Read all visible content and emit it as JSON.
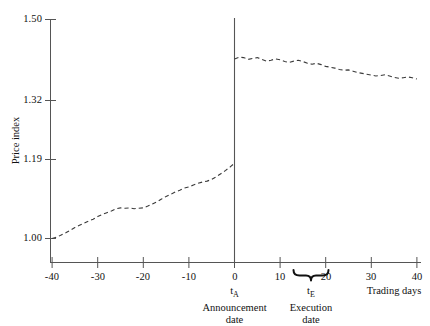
{
  "chart_data": {
    "type": "line",
    "title": "",
    "subtitle": "",
    "xlabel": "Trading days",
    "ylabel": "Price index",
    "xlim": [
      -40,
      40
    ],
    "ylim": [
      0.955,
      1.52
    ],
    "grid": false,
    "legend": null,
    "y_ticks": [
      "1.00",
      "1.19",
      "1.32",
      "1.50"
    ],
    "y_tick_values": [
      1.0,
      1.19,
      1.32,
      1.5
    ],
    "x_ticks": [
      "-40",
      "-30",
      "-20",
      "-10",
      "0",
      "10",
      "20",
      "30",
      "40"
    ],
    "x_tick_values": [
      -40,
      -30,
      -20,
      -10,
      0,
      10,
      20,
      30,
      40
    ],
    "line_style": "dashed",
    "line_color": "#3a3a3a",
    "annotations": [
      {
        "name": "announcement-date",
        "x": 0,
        "symbol": "t",
        "subscript": "A",
        "line1": "Announcement",
        "line2": "date",
        "marker": "vertical-line"
      },
      {
        "name": "execution-date",
        "x_start": 13,
        "x_end": 20,
        "x_center": 16.5,
        "symbol": "t",
        "subscript": "E",
        "line1": "Execution",
        "line2": "date",
        "marker": "brace"
      }
    ],
    "series": [
      {
        "name": "pre-announcement",
        "x": [
          -40,
          -39,
          -38,
          -37,
          -36,
          -35,
          -34,
          -33,
          -32,
          -31,
          -30,
          -29,
          -28,
          -27,
          -26,
          -25,
          -24,
          -23,
          -22,
          -21,
          -20,
          -19,
          -18,
          -17,
          -16,
          -15,
          -14,
          -13,
          -12,
          -11,
          -10,
          -9,
          -8,
          -7,
          -6,
          -5,
          -4,
          -3,
          -2,
          -1,
          0
        ],
        "values": [
          1.0,
          1.003,
          1.008,
          1.013,
          1.019,
          1.025,
          1.03,
          1.035,
          1.04,
          1.044,
          1.05,
          1.055,
          1.059,
          1.063,
          1.068,
          1.07,
          1.069,
          1.07,
          1.068,
          1.069,
          1.07,
          1.074,
          1.079,
          1.084,
          1.09,
          1.096,
          1.101,
          1.106,
          1.11,
          1.115,
          1.118,
          1.122,
          1.126,
          1.129,
          1.131,
          1.135,
          1.141,
          1.148,
          1.155,
          1.163,
          1.172
        ]
      },
      {
        "name": "post-announcement",
        "x": [
          0,
          1,
          2,
          3,
          4,
          5,
          6,
          7,
          8,
          9,
          10,
          11,
          12,
          13,
          14,
          15,
          16,
          17,
          18,
          19,
          20,
          21,
          22,
          23,
          24,
          25,
          26,
          27,
          28,
          29,
          30,
          31,
          32,
          33,
          34,
          35,
          36,
          37,
          38,
          39,
          40
        ],
        "values": [
          1.41,
          1.414,
          1.413,
          1.409,
          1.411,
          1.413,
          1.409,
          1.405,
          1.407,
          1.41,
          1.408,
          1.404,
          1.402,
          1.405,
          1.407,
          1.404,
          1.4,
          1.398,
          1.4,
          1.397,
          1.393,
          1.391,
          1.389,
          1.386,
          1.384,
          1.385,
          1.382,
          1.379,
          1.377,
          1.375,
          1.373,
          1.371,
          1.372,
          1.374,
          1.371,
          1.368,
          1.366,
          1.367,
          1.369,
          1.367,
          1.364
        ]
      }
    ]
  }
}
